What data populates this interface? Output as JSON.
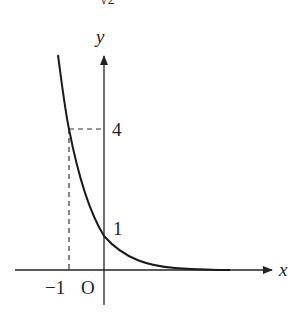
{
  "figure": {
    "top_fragment": "√2",
    "function": "y = (1/4)^x",
    "axes": {
      "x_label": "x",
      "y_label": "y",
      "origin_label": "O"
    },
    "tick_labels": {
      "x_neg_one": "−1",
      "y_four": "4",
      "y_one": "1"
    },
    "marked_points": [
      {
        "x": -1,
        "y": 4,
        "guides": "dashed"
      },
      {
        "x": 0,
        "y": 1
      }
    ],
    "colors": {
      "curve": "#1a1a1a",
      "axes": "#222222",
      "dashed": "#333333"
    }
  }
}
